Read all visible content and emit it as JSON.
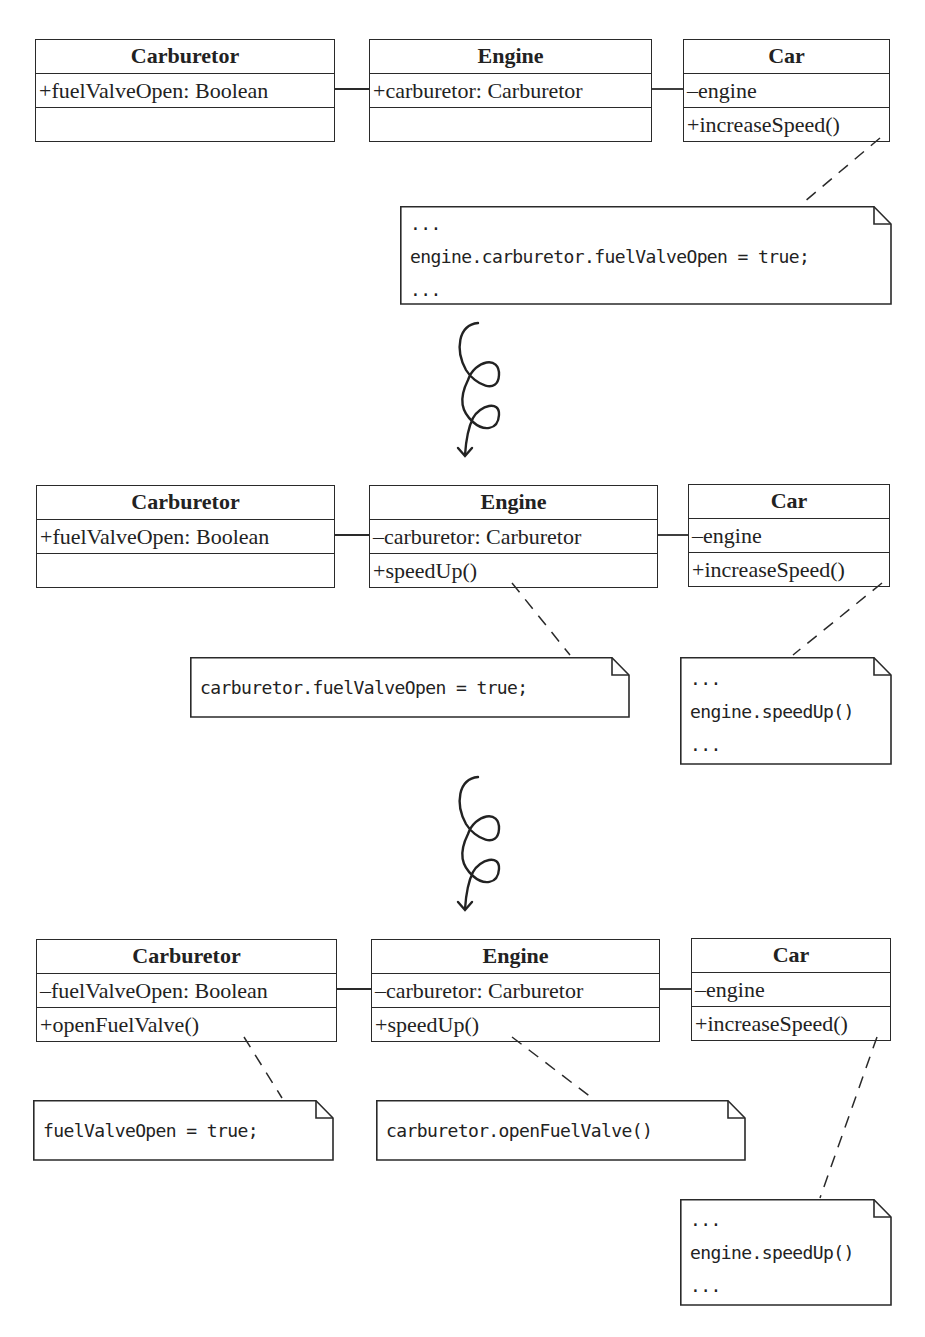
{
  "diagram": {
    "stages": [
      {
        "classes": {
          "carburetor": {
            "name": "Carburetor",
            "attributes": "+fuelValveOpen: Boolean",
            "operations": ""
          },
          "engine": {
            "name": "Engine",
            "attributes": "+carburetor: Carburetor",
            "operations": ""
          },
          "car": {
            "name": "Car",
            "attributes": "–engine",
            "operations": "+increaseSpeed()"
          }
        },
        "notes": {
          "car_note": [
            "...",
            "engine.carburetor.fuelValveOpen = true;",
            "..."
          ]
        }
      },
      {
        "classes": {
          "carburetor": {
            "name": "Carburetor",
            "attributes": "+fuelValveOpen: Boolean",
            "operations": ""
          },
          "engine": {
            "name": "Engine",
            "attributes": "–carburetor: Carburetor",
            "operations": "+speedUp()"
          },
          "car": {
            "name": "Car",
            "attributes": "–engine",
            "operations": "+increaseSpeed()"
          }
        },
        "notes": {
          "engine_note": [
            "carburetor.fuelValveOpen = true;"
          ],
          "car_note": [
            "...",
            "engine.speedUp()",
            "..."
          ]
        }
      },
      {
        "classes": {
          "carburetor": {
            "name": "Carburetor",
            "attributes": "–fuelValveOpen: Boolean",
            "operations": "+openFuelValve()"
          },
          "engine": {
            "name": "Engine",
            "attributes": "–carburetor: Carburetor",
            "operations": "+speedUp()"
          },
          "car": {
            "name": "Car",
            "attributes": "–engine",
            "operations": "+increaseSpeed()"
          }
        },
        "notes": {
          "carburetor_note": [
            "fuelValveOpen = true;"
          ],
          "engine_note": [
            "carburetor.openFuelValve()"
          ],
          "car_note": [
            "...",
            "engine.speedUp()",
            "..."
          ]
        }
      }
    ],
    "transitions": [
      {
        "icon": "curly-arrow-down-icon"
      },
      {
        "icon": "curly-arrow-down-icon"
      }
    ],
    "colors": {
      "stroke": "#2a2a2a",
      "text": "#222222",
      "background": "#ffffff"
    }
  }
}
